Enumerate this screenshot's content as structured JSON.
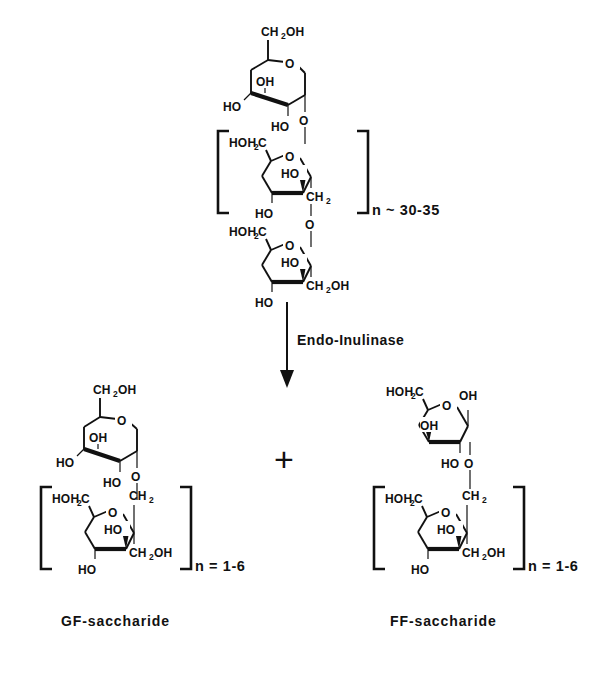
{
  "figure": {
    "background_color": "#ffffff",
    "ink_color": "#111111"
  },
  "reaction": {
    "enzyme_label": "Endo-Inulinase",
    "plus_sign": "+",
    "arrow_direction": "down"
  },
  "substrate": {
    "name_label": "",
    "repeat_label": "n ~ 30-35",
    "glucose_unit": {
      "labels": {
        "c6": "CH",
        "c6_sub": "2",
        "c6_tail": "OH",
        "ring_o": "O",
        "oh_top": "OH",
        "ho_left": "HO",
        "ho_bottom": "HO",
        "link_o": "O"
      }
    },
    "fructose_unit_1": {
      "labels": {
        "c1": "HOH",
        "c1_sub": "2",
        "c1_tail": "C",
        "ring_o": "O",
        "ho_inner": "HO",
        "ho_bottom": "HO",
        "ch2": "CH",
        "ch2_sub": "2",
        "link_o": "O"
      }
    },
    "fructose_unit_2": {
      "labels": {
        "c1": "HOH",
        "c1_sub": "2",
        "c1_tail": "C",
        "ring_o": "O",
        "ho_inner": "HO",
        "ho_bottom": "HO",
        "ch2oh": "CH",
        "ch2oh_sub": "2",
        "ch2oh_tail": "OH"
      }
    }
  },
  "products": [
    {
      "id": "gf-saccharide",
      "caption": "GF-saccharide",
      "repeat_label": "n = 1-6",
      "terminal_unit_type": "glucose",
      "glucose_unit": {
        "labels": {
          "c6": "CH",
          "c6_sub": "2",
          "c6_tail": "OH",
          "ring_o": "O",
          "oh_top": "OH",
          "ho_left": "HO",
          "ho_bottom": "HO",
          "link_o": "O"
        }
      },
      "fructose_unit": {
        "labels": {
          "c1": "HOH",
          "c1_sub": "2",
          "c1_tail": "C",
          "ring_o": "O",
          "ho_inner": "HO",
          "ho_bottom": "HO",
          "ch2": "CH",
          "ch2_sub": "2",
          "ch2oh": "CH",
          "ch2oh_sub": "2",
          "ch2oh_tail": "OH"
        }
      }
    },
    {
      "id": "ff-saccharide",
      "caption": "FF-saccharide",
      "repeat_label": "n = 1-6",
      "terminal_unit_type": "fructose",
      "fructose_terminal_unit": {
        "labels": {
          "c1": "HOH",
          "c1_sub": "2",
          "c1_tail": "C",
          "ring_o": "O",
          "oh_top": "OH",
          "oh_inner": "OH",
          "ho_bottom": "HO",
          "link_o": "O"
        }
      },
      "fructose_unit": {
        "labels": {
          "c1": "HOH",
          "c1_sub": "2",
          "c1_tail": "C",
          "ring_o": "O",
          "ho_inner": "HO",
          "ho_bottom": "HO",
          "ch2": "CH",
          "ch2_sub": "2",
          "ch2oh": "CH",
          "ch2oh_sub": "2",
          "ch2oh_tail": "OH"
        }
      }
    }
  ]
}
